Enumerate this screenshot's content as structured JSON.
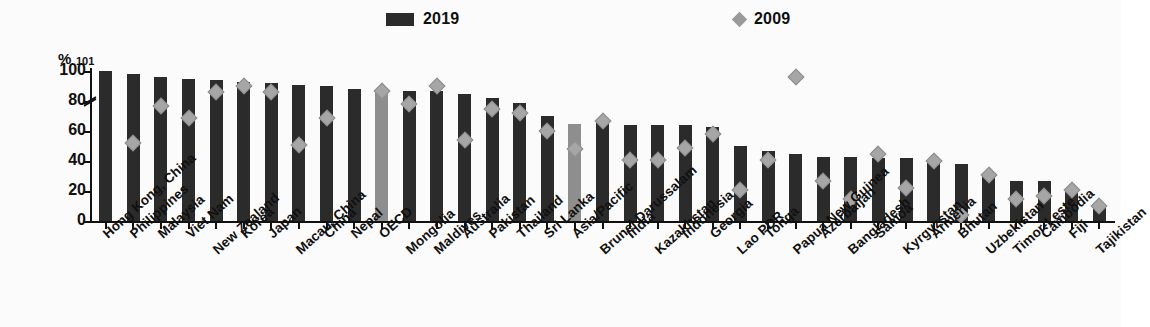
{
  "legend": {
    "series": [
      {
        "key": "2019",
        "label": "2019",
        "marker": "bar-swatch",
        "color": "#2b2b2b"
      },
      {
        "key": "2009",
        "label": "2009",
        "marker": "diamond-swatch",
        "color": "#9a9a9a"
      }
    ]
  },
  "axis": {
    "y_unit": "%",
    "y_top_note": "101",
    "y_ticks": [
      "100",
      "80",
      "60",
      "40",
      "20",
      "0"
    ],
    "has_axis_break": true
  },
  "colors": {
    "bar_2019": "#2b2b2b",
    "bar_aggregate": "#8e8e8e",
    "marker_2009": "#a6a6a6",
    "axis": "#111111",
    "background": "#fbfbfb"
  },
  "chart_data": {
    "type": "bar",
    "title": "",
    "subtitle": "",
    "xlabel": "",
    "ylabel": "%",
    "ylim": [
      0,
      100
    ],
    "y_ticks": [
      0,
      20,
      40,
      60,
      80,
      100
    ],
    "grid": false,
    "legend_position": "top",
    "note": "First bar (Hong Kong, China) is truncated at the axis break; its true value is 101.",
    "categories": [
      "Hong Kong, China",
      "Philippines",
      "Malaysia",
      "Viet Nam",
      "New Zealand",
      "Korea",
      "Japan",
      "Macau, China",
      "China",
      "Nepal",
      "OECD",
      "Mongolia",
      "Maldives",
      "Australia",
      "Pakistan",
      "Thailand",
      "Sri Lanka",
      "Asia/Pacific",
      "Brunei Darussalam",
      "India",
      "Kazakhstan",
      "Indonesia",
      "Georgia",
      "Lao PDR",
      "Tonga",
      "Papua New Guinea",
      "Azerbaijan",
      "Bangladesh",
      "Samoa",
      "Kyrgyzstan",
      "Armenia",
      "Bhutan",
      "Uzbekistan",
      "Timor-Leste",
      "Cambodia",
      "Fiji",
      "Tajikistan"
    ],
    "aggregate_categories": [
      "OECD",
      "Asia/Pacific"
    ],
    "series": [
      {
        "name": "2019",
        "values": [
          101,
          98,
          96,
          95,
          94,
          93,
          92,
          91,
          90,
          88,
          87,
          87,
          87,
          85,
          82,
          79,
          70,
          65,
          67,
          64,
          64,
          64,
          63,
          50,
          47,
          45,
          43,
          43,
          42,
          42,
          41,
          38,
          31,
          27,
          27,
          22,
          11
        ]
      },
      {
        "name": "2009",
        "values": [
          null,
          52,
          77,
          69,
          86,
          90,
          86,
          51,
          69,
          null,
          87,
          78,
          90,
          54,
          75,
          72,
          60,
          48,
          67,
          41,
          41,
          49,
          58,
          21,
          41,
          96,
          27,
          15,
          45,
          22,
          40,
          4,
          31,
          15,
          17,
          21,
          10
        ]
      }
    ]
  }
}
